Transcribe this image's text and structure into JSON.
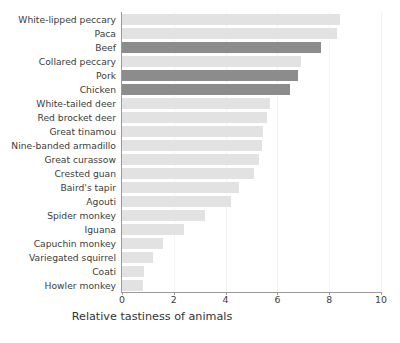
{
  "chart_data": {
    "type": "bar",
    "orientation": "horizontal",
    "title": "",
    "xlabel": "Relative tastiness of animals",
    "ylabel": "",
    "xlim": [
      0,
      10
    ],
    "xticks": [
      "0",
      "2",
      "4",
      "6",
      "8",
      "10"
    ],
    "grid": "vertical",
    "legend": "none",
    "colors": {
      "bar_default": "#e2e2e2",
      "bar_highlight": "#8c8c8c",
      "axis": "#9a9a9a",
      "text": "#3c3c3c",
      "background": "#ffffff"
    },
    "categories": [
      "White-lipped peccary",
      "Paca",
      "Beef",
      "Collared peccary",
      "Pork",
      "Chicken",
      "White-tailed deer",
      "Red brocket deer",
      "Great tinamou",
      "Nine-banded armadillo",
      "Great curassow",
      "Crested guan",
      "Baird's tapir",
      "Agouti",
      "Spider monkey",
      "Iguana",
      "Capuchin monkey",
      "Variegated squirrel",
      "Coati",
      "Howler monkey"
    ],
    "values": [
      8.4,
      8.3,
      7.7,
      6.9,
      6.8,
      6.5,
      5.7,
      5.6,
      5.45,
      5.4,
      5.3,
      5.1,
      4.5,
      4.2,
      3.2,
      2.4,
      1.6,
      1.2,
      0.85,
      0.8
    ],
    "highlighted": [
      "Beef",
      "Pork",
      "Chicken"
    ],
    "highlight_note": "domesticated meats shown in dark grey"
  }
}
